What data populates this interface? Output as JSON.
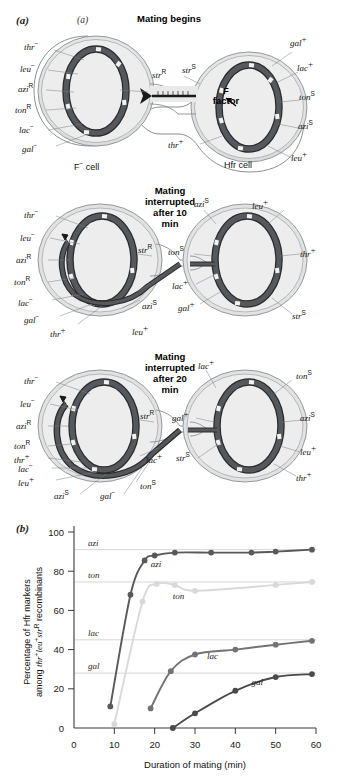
{
  "figure": {
    "panel_a_letter": "(a)",
    "panel_a_letter_inner": "(a)",
    "panel_b_letter": "(b)"
  },
  "diagram": {
    "stages": [
      {
        "id": "mating-begins",
        "title": "Mating begins",
        "title_lines": [
          "Mating begins"
        ],
        "left_cell_label": "F− cell",
        "right_cell_label": "Hfr cell",
        "f_factor_label": "F factor",
        "f_factor_label_lines": [
          "F",
          "factor"
        ],
        "left_markers": [
          "thr−",
          "leu−",
          "azi R",
          "ton R",
          "lac−",
          "gal−",
          "str R"
        ],
        "right_markers": [
          "gal +",
          "lac +",
          "ton S",
          "azi S",
          "leu +",
          "thr +",
          "str S"
        ]
      },
      {
        "id": "interrupted-10",
        "title": "Mating interrupted after 10 min",
        "title_lines": [
          "Mating",
          "interrupted",
          "after 10",
          "min"
        ],
        "left_markers": [
          "thr−",
          "leu−",
          "azi R",
          "ton R",
          "lac−",
          "gal−",
          "thr +",
          "leu +",
          "azi S",
          "str R"
        ],
        "right_markers": [
          "azi S",
          "leu +",
          "thr +",
          "ton S",
          "lac +",
          "gal +",
          "str S"
        ]
      },
      {
        "id": "interrupted-20",
        "title": "Mating interrupted after 20 min",
        "title_lines": [
          "Mating",
          "interrupted",
          "after 20",
          "min"
        ],
        "left_markers": [
          "thr−",
          "leu−",
          "azi R",
          "ton R",
          "thr +",
          "lac−",
          "leu +",
          "azi S",
          "gal−",
          "ton S",
          "lac +",
          "str R"
        ],
        "right_markers": [
          "lac +",
          "ton S",
          "azi S",
          "leu +",
          "thr +",
          "gal +",
          "str S"
        ]
      }
    ]
  },
  "chart_data": {
    "type": "line",
    "title": "",
    "xlabel": "Duration of mating (min)",
    "ylabel": "Percentage of Hfr markers among thr+ leu+ str R recombinants",
    "ylabel_line1": "Percentage of Hfr markers",
    "ylabel_line2_pre": "among ",
    "ylabel_line2_thr": "thr",
    "ylabel_line2_leu": "leu",
    "ylabel_line2_str": "str",
    "ylabel_line2_post": " recombinants",
    "xlim": [
      0,
      60
    ],
    "ylim": [
      0,
      100
    ],
    "xticks": [
      0,
      10,
      20,
      30,
      40,
      50,
      60
    ],
    "yticks": [
      0,
      20,
      40,
      60,
      80,
      100
    ],
    "grid": true,
    "gridlines": [
      {
        "label": "azi",
        "value": 91
      },
      {
        "label": "ton",
        "value": 74.5
      },
      {
        "label": "lac",
        "value": 45
      },
      {
        "label": "gal",
        "value": 28
      }
    ],
    "series": [
      {
        "name": "azi",
        "color": "#595959",
        "label_x": 19,
        "label_y": 82,
        "points": [
          {
            "x": 9,
            "y": 11
          },
          {
            "x": 14,
            "y": 68
          },
          {
            "x": 17.5,
            "y": 85.5
          },
          {
            "x": 20,
            "y": 88
          },
          {
            "x": 25,
            "y": 89.5
          },
          {
            "x": 34,
            "y": 89.5
          },
          {
            "x": 44,
            "y": 89.5
          },
          {
            "x": 50,
            "y": 90
          },
          {
            "x": 59,
            "y": 91
          }
        ]
      },
      {
        "name": "ton",
        "color": "#d9d9d9",
        "label_x": 24.5,
        "label_y": 66,
        "points": [
          {
            "x": 10,
            "y": 2
          },
          {
            "x": 17,
            "y": 64.5
          },
          {
            "x": 20.5,
            "y": 73.5
          },
          {
            "x": 25,
            "y": 73
          },
          {
            "x": 30,
            "y": 70
          },
          {
            "x": 50,
            "y": 73
          },
          {
            "x": 59,
            "y": 74.5
          }
        ]
      },
      {
        "name": "lac",
        "color": "#737373",
        "label_x": 33,
        "label_y": 35,
        "points": [
          {
            "x": 19,
            "y": 10
          },
          {
            "x": 24,
            "y": 29
          },
          {
            "x": 30,
            "y": 37.5
          },
          {
            "x": 40,
            "y": 40
          },
          {
            "x": 50,
            "y": 42.5
          },
          {
            "x": 59,
            "y": 44.5
          }
        ]
      },
      {
        "name": "gal",
        "color": "#4a4a4a",
        "label_x": 44,
        "label_y": 22,
        "points": [
          {
            "x": 24.5,
            "y": 0
          },
          {
            "x": 30,
            "y": 7.5
          },
          {
            "x": 40,
            "y": 19
          },
          {
            "x": 50,
            "y": 26
          },
          {
            "x": 59,
            "y": 27.5
          }
        ]
      }
    ]
  }
}
